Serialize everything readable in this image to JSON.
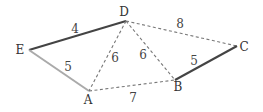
{
  "diagram": {
    "type": "weighted-graph",
    "nodes": [
      {
        "id": "D",
        "label": "D",
        "x": 126,
        "y": 21,
        "lx": 124,
        "ly": 16
      },
      {
        "id": "E",
        "label": "E",
        "x": 29,
        "y": 50,
        "lx": 20,
        "ly": 54
      },
      {
        "id": "A",
        "label": "A",
        "x": 89,
        "y": 91,
        "lx": 88,
        "ly": 104
      },
      {
        "id": "B",
        "label": "B",
        "x": 175,
        "y": 80,
        "lx": 178,
        "ly": 91
      },
      {
        "id": "C",
        "label": "C",
        "x": 237,
        "y": 46,
        "lx": 244,
        "ly": 51
      }
    ],
    "edges": [
      {
        "from": "E",
        "to": "D",
        "weight": "4",
        "style": "solid",
        "color": "#444444",
        "lx": 75,
        "ly": 33
      },
      {
        "from": "E",
        "to": "A",
        "weight": "5",
        "style": "solid",
        "color": "#aaaaaa",
        "lx": 68,
        "ly": 71
      },
      {
        "from": "D",
        "to": "A",
        "weight": "6",
        "style": "dashed",
        "color": "#777777",
        "lx": 115,
        "ly": 62
      },
      {
        "from": "D",
        "to": "B",
        "weight": "6",
        "style": "dashed",
        "color": "#777777",
        "lx": 143,
        "ly": 59
      },
      {
        "from": "D",
        "to": "C",
        "weight": "8",
        "style": "dashed",
        "color": "#777777",
        "lx": 180,
        "ly": 28
      },
      {
        "from": "A",
        "to": "B",
        "weight": "7",
        "style": "dashed",
        "color": "#777777",
        "lx": 133,
        "ly": 102
      },
      {
        "from": "B",
        "to": "C",
        "weight": "5",
        "style": "solid",
        "color": "#444444",
        "lx": 194,
        "ly": 65
      }
    ]
  }
}
